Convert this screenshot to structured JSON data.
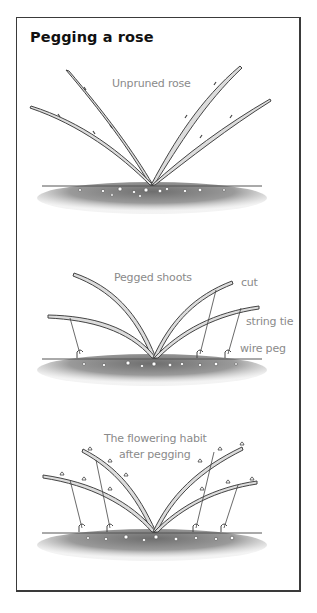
{
  "title": "Pegging a rose",
  "panels": [
    {
      "id": "unpruned",
      "caption": "Unpruned rose"
    },
    {
      "id": "pegged",
      "caption": "Pegged shoots",
      "annotations": [
        "cut",
        "string tie",
        "wire peg"
      ]
    },
    {
      "id": "flowering",
      "caption_line1": "The flowering habit",
      "caption_line2": "after pegging"
    }
  ],
  "colors": {
    "border": "#3a3a3a",
    "stem_fill": "#d8d8d8",
    "stem_outline": "#4a4a4a",
    "soil": "#8a8a8a",
    "label_text": "#8a8a8a",
    "title_text": "#111111"
  }
}
